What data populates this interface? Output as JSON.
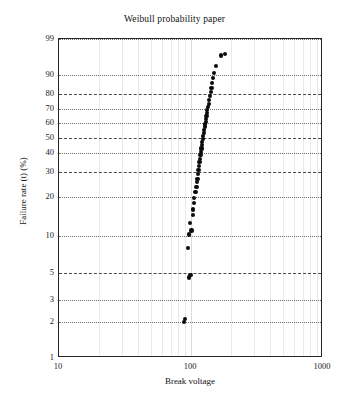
{
  "chart_data": {
    "type": "scatter",
    "title": "Weibull probability paper",
    "xlabel": "Break voltage",
    "ylabel": "Failure rate (t) (%)",
    "xscale": "log",
    "yscale": "weibull",
    "xlim": [
      10,
      1000
    ],
    "ylim": [
      1,
      99
    ],
    "grid": true,
    "legend": null,
    "xticks": [
      {
        "value": 10,
        "label": "10"
      },
      {
        "value": 100,
        "label": "100"
      },
      {
        "value": 1000,
        "label": "1000"
      }
    ],
    "yticks": [
      {
        "value": 99,
        "label": "99",
        "style": "dotted"
      },
      {
        "value": 90,
        "label": "90",
        "style": "dotted"
      },
      {
        "value": 80,
        "label": "80",
        "style": "dashed"
      },
      {
        "value": 70,
        "label": "70",
        "style": "dotted"
      },
      {
        "value": 60,
        "label": "60",
        "style": "dotted"
      },
      {
        "value": 50,
        "label": "50",
        "style": "dashed"
      },
      {
        "value": 40,
        "label": "40",
        "style": "dotted"
      },
      {
        "value": 30,
        "label": "30",
        "style": "dashed"
      },
      {
        "value": 20,
        "label": "20",
        "style": "dotted"
      },
      {
        "value": 10,
        "label": "10",
        "style": "dotted"
      },
      {
        "value": 5,
        "label": "5",
        "style": "dashed"
      },
      {
        "value": 3,
        "label": "3",
        "style": "dotted"
      },
      {
        "value": 2,
        "label": "2",
        "style": "dotted"
      },
      {
        "value": 1,
        "label": "1",
        "style": "axis"
      }
    ],
    "points": [
      {
        "x": 88,
        "y": 2.0
      },
      {
        "x": 90,
        "y": 2.1
      },
      {
        "x": 96,
        "y": 4.6
      },
      {
        "x": 99,
        "y": 4.8
      },
      {
        "x": 95,
        "y": 8.0
      },
      {
        "x": 97,
        "y": 10.2
      },
      {
        "x": 101,
        "y": 11.0
      },
      {
        "x": 98,
        "y": 12.5
      },
      {
        "x": 103,
        "y": 14.5
      },
      {
        "x": 104,
        "y": 16.0
      },
      {
        "x": 105,
        "y": 18.0
      },
      {
        "x": 106,
        "y": 19.5
      },
      {
        "x": 108,
        "y": 21.5
      },
      {
        "x": 110,
        "y": 23.5
      },
      {
        "x": 111,
        "y": 25.5
      },
      {
        "x": 112,
        "y": 27.0
      },
      {
        "x": 113,
        "y": 29.0
      },
      {
        "x": 114,
        "y": 31.0
      },
      {
        "x": 115,
        "y": 33.0
      },
      {
        "x": 116,
        "y": 35.0
      },
      {
        "x": 117,
        "y": 37.0
      },
      {
        "x": 118,
        "y": 39.0
      },
      {
        "x": 119,
        "y": 41.0
      },
      {
        "x": 120,
        "y": 43.0
      },
      {
        "x": 121,
        "y": 45.0
      },
      {
        "x": 122,
        "y": 47.0
      },
      {
        "x": 123,
        "y": 49.0
      },
      {
        "x": 124,
        "y": 51.0
      },
      {
        "x": 125,
        "y": 53.0
      },
      {
        "x": 126,
        "y": 55.0
      },
      {
        "x": 127,
        "y": 57.0
      },
      {
        "x": 128,
        "y": 59.0
      },
      {
        "x": 129,
        "y": 61.0
      },
      {
        "x": 130,
        "y": 63.0
      },
      {
        "x": 131,
        "y": 65.0
      },
      {
        "x": 132,
        "y": 67.0
      },
      {
        "x": 133,
        "y": 69.0
      },
      {
        "x": 134,
        "y": 71.0
      },
      {
        "x": 136,
        "y": 73.5
      },
      {
        "x": 137,
        "y": 76.0
      },
      {
        "x": 139,
        "y": 78.5
      },
      {
        "x": 141,
        "y": 81.0
      },
      {
        "x": 143,
        "y": 83.5
      },
      {
        "x": 145,
        "y": 86.0
      },
      {
        "x": 147,
        "y": 88.5
      },
      {
        "x": 150,
        "y": 91.0
      },
      {
        "x": 155,
        "y": 93.5
      },
      {
        "x": 168,
        "y": 96.5
      },
      {
        "x": 182,
        "y": 96.8
      }
    ]
  }
}
